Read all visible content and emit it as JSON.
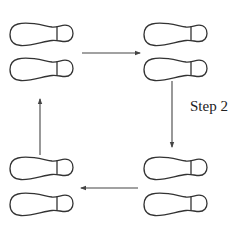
{
  "diagram": {
    "colors": {
      "outline": "#333333",
      "arrow": "#444444",
      "background": "#ffffff"
    },
    "labels": [
      {
        "id": "step2",
        "text": "Step 2",
        "x": 190,
        "y": 99
      }
    ],
    "footprint_pairs": [
      {
        "id": "top-left",
        "position": "top-left",
        "shoes": [
          {
            "x": 10,
            "y": 22
          },
          {
            "x": 10,
            "y": 57
          }
        ]
      },
      {
        "id": "top-right",
        "position": "top-right",
        "shoes": [
          {
            "x": 144,
            "y": 22
          },
          {
            "x": 144,
            "y": 57
          }
        ]
      },
      {
        "id": "bottom-right",
        "position": "bottom-right",
        "shoes": [
          {
            "x": 144,
            "y": 156
          },
          {
            "x": 144,
            "y": 192
          }
        ]
      },
      {
        "id": "bottom-left",
        "position": "bottom-left",
        "shoes": [
          {
            "x": 10,
            "y": 156
          },
          {
            "x": 10,
            "y": 192
          }
        ]
      }
    ],
    "arrows": [
      {
        "id": "top-to-right",
        "from": "top-left",
        "to": "top-right",
        "direction": "right",
        "x1": 82,
        "y1": 53,
        "x2": 140,
        "y2": 53
      },
      {
        "id": "right-down",
        "from": "top-right",
        "to": "bottom-right",
        "direction": "down",
        "x1": 172,
        "y1": 81,
        "x2": 172,
        "y2": 147
      },
      {
        "id": "bottom-to-left",
        "from": "bottom-right",
        "to": "bottom-left",
        "direction": "left",
        "x1": 138,
        "y1": 188,
        "x2": 81,
        "y2": 188
      },
      {
        "id": "left-up",
        "from": "bottom-left",
        "to": "top-left",
        "direction": "up",
        "x1": 40,
        "y1": 155,
        "x2": 40,
        "y2": 99
      }
    ]
  }
}
